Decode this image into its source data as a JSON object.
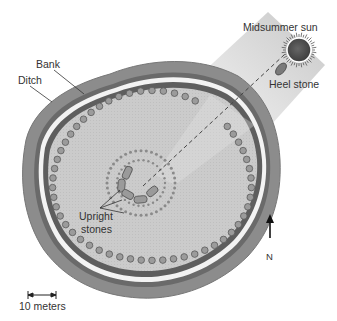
{
  "diagram": {
    "labels": {
      "midsummer_sun": "Midsummer sun",
      "heel_stone": "Heel stone",
      "bank": "Bank",
      "ditch": "Ditch",
      "upright_stones": "Upright stones",
      "upright_line1": "Upright",
      "upright_line2": "stones",
      "north": "N",
      "scale": "10 meters"
    },
    "colors": {
      "ditch": "#8a8a8a",
      "ditch_dark": "#6e6e6e",
      "bank_highlight": "#f2f2f2",
      "inner_ring": "#5e5e5e",
      "interior": "#c9c9c9",
      "post_holes": "#9a9a9a",
      "post_hole_stroke": "#5a5a5a",
      "sun": "#555555",
      "beam": "#dcdcdc",
      "text": "#333333"
    }
  }
}
